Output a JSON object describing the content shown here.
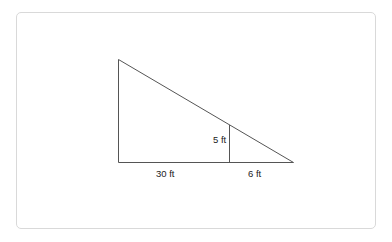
{
  "diagram": {
    "type": "right-triangle-similar",
    "labels": {
      "base_left": "30 ft",
      "base_right": "6 ft",
      "inner_height": "5 ft"
    },
    "colors": {
      "stroke": "#555555",
      "frame": "#d9d9d9"
    }
  }
}
